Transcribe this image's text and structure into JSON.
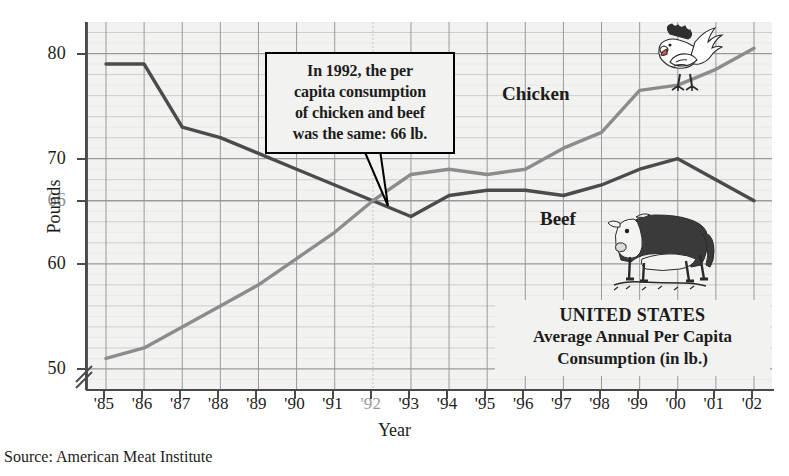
{
  "chart_data": {
    "type": "line",
    "title": "UNITED STATES Average Annual Per Capita Consumption (in lb.)",
    "xlabel": "Year",
    "ylabel": "Pounds",
    "ylim": [
      48,
      83
    ],
    "yticks": [
      50,
      60,
      66,
      70,
      80
    ],
    "ytick_labels": [
      "50",
      "60",
      "66",
      "70",
      "80"
    ],
    "highlight_ytick": "66",
    "grid": true,
    "legend": "inline-labels",
    "axis_break": true,
    "categories": [
      "'85",
      "'86",
      "'87",
      "'88",
      "'89",
      "'90",
      "'91",
      "'92",
      "'93",
      "'94",
      "'95",
      "'96",
      "'97",
      "'98",
      "'99",
      "'00",
      "'01",
      "'02"
    ],
    "highlight_category": "'92",
    "series": [
      {
        "name": "Beef",
        "color": "#4b4b4b",
        "values": [
          79,
          79,
          73,
          72,
          70.5,
          69,
          67.5,
          66,
          64.5,
          66.5,
          67,
          67,
          66.5,
          67.5,
          69,
          70,
          68,
          66
        ]
      },
      {
        "name": "Chicken",
        "color": "#8c8c8c",
        "values": [
          51,
          52,
          54,
          56,
          58,
          60.5,
          63,
          66,
          68.5,
          69,
          68.5,
          69,
          71,
          72.5,
          76.5,
          77,
          78.5,
          80.5
        ]
      }
    ],
    "annotations": [
      {
        "name": "callout-1992",
        "text": "In 1992, the per capita consumption of chicken and beef was the same: 66 lb.",
        "points_to": {
          "x": "'92",
          "y": 66
        }
      }
    ]
  },
  "callout": {
    "line1": "In 1992, the per",
    "line2": "capita consumption",
    "line3": "of chicken and beef",
    "line4": "was the same: 66 lb."
  },
  "title_box": {
    "line1": "UNITED STATES",
    "line2": "Average Annual Per Capita",
    "line3": "Consumption (in lb.)"
  },
  "axes": {
    "y_title": "Pounds",
    "x_title": "Year"
  },
  "series_labels": {
    "chicken": "Chicken",
    "beef": "Beef"
  },
  "source": {
    "text": "Source: American Meat Institute"
  },
  "colors": {
    "beef_line": "#4b4b4b",
    "chicken_line": "#8c8c8c",
    "plot_background": "#f2f2f0",
    "grid_major": "#9a9a9a",
    "grid_minor": "#c9c9c9",
    "axis": "#4a4a4a",
    "highlight_text": "#8e8e8e"
  }
}
